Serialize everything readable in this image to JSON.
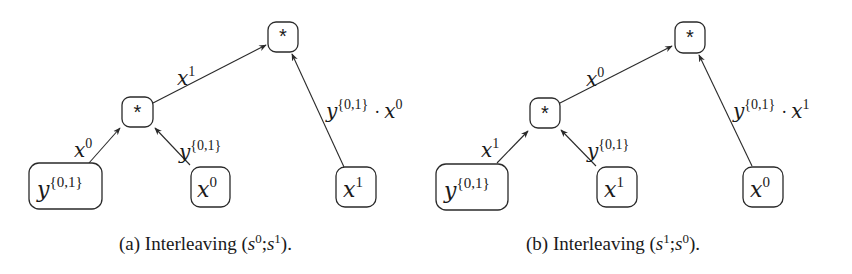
{
  "figure": {
    "panels": [
      {
        "id": "a",
        "caption": {
          "prefix": "(a) Interleaving (",
          "s1_base": "s",
          "s1_sup": "0",
          "sep": ";",
          "s2_base": "s",
          "s2_sup": "1",
          "suffix": ")."
        },
        "nodes": {
          "root": {
            "label": "*"
          },
          "mid": {
            "label": "*"
          },
          "leaf_y": {
            "base": "y",
            "sup": "{0,1}"
          },
          "leaf_x_mid": {
            "base": "x",
            "sup": "0"
          },
          "leaf_x_right": {
            "base": "x",
            "sup": "1"
          }
        },
        "edges": {
          "leafy_to_mid": {
            "base": "x",
            "sup": "0"
          },
          "leafx_to_mid": {
            "base": "y",
            "sup": "{0,1}"
          },
          "mid_to_root": {
            "base": "x",
            "sup": "1"
          },
          "right_to_root": {
            "base": "y",
            "sup": "{0,1}",
            "dot": "·",
            "base2": "x",
            "sup2": "0"
          }
        }
      },
      {
        "id": "b",
        "caption": {
          "prefix": "(b) Interleaving (",
          "s1_base": "s",
          "s1_sup": "1",
          "sep": ";",
          "s2_base": "s",
          "s2_sup": "0",
          "suffix": ")."
        },
        "nodes": {
          "root": {
            "label": "*"
          },
          "mid": {
            "label": "*"
          },
          "leaf_y": {
            "base": "y",
            "sup": "{0,1}"
          },
          "leaf_x_mid": {
            "base": "x",
            "sup": "1"
          },
          "leaf_x_right": {
            "base": "x",
            "sup": "0"
          }
        },
        "edges": {
          "leafy_to_mid": {
            "base": "x",
            "sup": "1"
          },
          "leafx_to_mid": {
            "base": "y",
            "sup": "{0,1}"
          },
          "mid_to_root": {
            "base": "x",
            "sup": "0"
          },
          "right_to_root": {
            "base": "y",
            "sup": "{0,1}",
            "dot": "·",
            "base2": "x",
            "sup2": "1"
          }
        }
      }
    ]
  }
}
